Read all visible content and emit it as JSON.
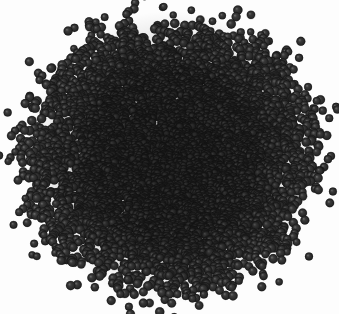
{
  "image": {
    "domain": "Natural-Image",
    "title": "Dense heap of dark spherical particles",
    "caption": "A large circular pile of many thousands of small dark-gray spheres photographed from above on a plain white background",
    "width": 339,
    "height": 314,
    "background_color": "#fdfdfd",
    "subject_name": "particle-heap"
  },
  "heap": {
    "center_x": 171,
    "center_y": 157,
    "radius_x": 149,
    "radius_y": 139,
    "bounds": {
      "left": 22,
      "top": 18,
      "right": 320,
      "bottom": 296
    },
    "shape": "flattened-disc",
    "edge_character": "ragged",
    "particle_count": 6200,
    "stray_particle_count": 170
  },
  "particle": {
    "name": "sphere",
    "shape": "circle",
    "min_diameter": 5.2,
    "max_diameter": 9.4,
    "mean_diameter": 7.1,
    "base_color": "#2f2f2f",
    "dark_color": "#1c1c1c",
    "light_color": "#474747",
    "highlight_color": "#6d6d6d",
    "rim_color": "#141414",
    "highlight_offset_x": -0.28,
    "highlight_offset_y": -0.3,
    "highlight_radius_factor": 0.55,
    "opacity": 1
  },
  "rendering": {
    "seed": 20240517,
    "core_density": 1,
    "edge_falloff": 0.62,
    "center_darkening": 0.3,
    "noise_amount": 0.11,
    "blur_radius": 0.35
  },
  "colors": {
    "background": "#fdfdfd",
    "particle_mid": "#2f2f2f",
    "particle_dark": "#1c1c1c",
    "particle_light": "#474747",
    "particle_highlight": "#6d6d6d"
  }
}
